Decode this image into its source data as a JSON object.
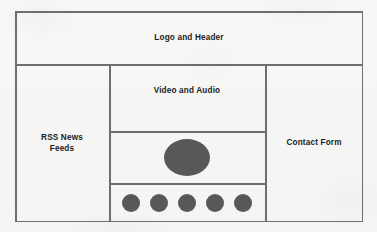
{
  "document": {
    "type": "website-layout-wireframe",
    "background_color": "#f6f6f4",
    "line_color": "#6e6e6e",
    "shape_fill_color": "#585858",
    "text_color": "#1c1c1c"
  },
  "regions": {
    "header": {
      "label": "Logo and Header"
    },
    "left_column": {
      "label": "RSS News\nFeeds"
    },
    "center_column": {
      "media_label": "Video and Audio",
      "player": {
        "shape": "ellipse",
        "count": 1
      },
      "thumbnails": {
        "shape": "circle",
        "count": 5,
        "items": [
          {
            "index": 1
          },
          {
            "index": 2
          },
          {
            "index": 3
          },
          {
            "index": 4
          },
          {
            "index": 5
          }
        ]
      }
    },
    "right_column": {
      "label": "Contact Form"
    }
  }
}
